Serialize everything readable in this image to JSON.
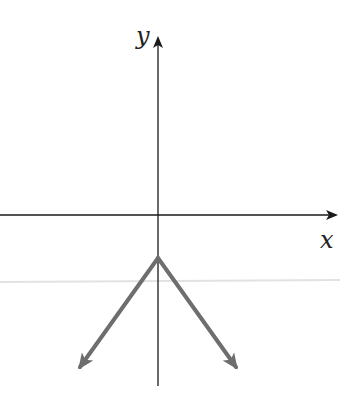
{
  "axes": {
    "x_label": "x",
    "y_label": "y",
    "axis_color": "#1a1a1a"
  },
  "graph": {
    "description": "Inverted V (downward-opening absolute value graph) with vertex on negative y-axis",
    "vertex": [
      0,
      -1
    ],
    "line_color": "#6e6e6e",
    "scan_line_color": "#e0e0e0"
  }
}
